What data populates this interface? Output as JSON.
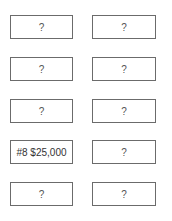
{
  "grid": {
    "rows": [
      {
        "left": "?",
        "right": "?"
      },
      {
        "left": "?",
        "right": "?"
      },
      {
        "left": "?",
        "right": "?"
      },
      {
        "left": "#8 $25,000",
        "right": "?"
      },
      {
        "left": "?",
        "right": "?"
      }
    ]
  }
}
